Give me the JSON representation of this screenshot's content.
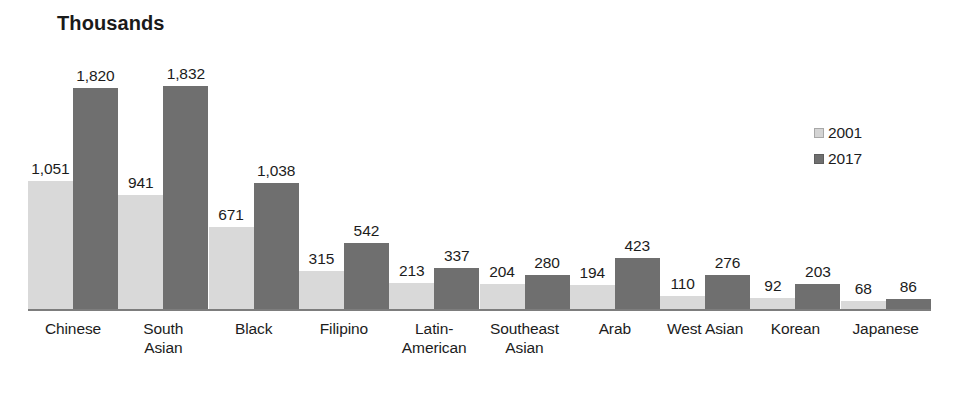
{
  "chart_data": {
    "type": "bar",
    "title": "Thousands",
    "xlabel": "",
    "ylabel": "",
    "ylim": [
      0,
      1832
    ],
    "grid": false,
    "legend_position": "right",
    "categories": [
      "Chinese",
      "South Asian",
      "Black",
      "Filipino",
      "Latin-American",
      "Southeast Asian",
      "Arab",
      "West Asian",
      "Korean",
      "Japanese"
    ],
    "category_lines": [
      [
        "Chinese"
      ],
      [
        "South",
        "Asian"
      ],
      [
        "Black"
      ],
      [
        "Filipino"
      ],
      [
        "Latin-",
        "American"
      ],
      [
        "Southeast",
        "Asian"
      ],
      [
        "Arab"
      ],
      [
        "West Asian"
      ],
      [
        "Korean"
      ],
      [
        "Japanese"
      ]
    ],
    "series": [
      {
        "name": "2001",
        "color": "#d9d9d9",
        "values": [
          1051,
          941,
          671,
          315,
          213,
          204,
          194,
          110,
          92,
          68
        ],
        "value_labels": [
          "1,051",
          "941",
          "671",
          "315",
          "213",
          "204",
          "194",
          "110",
          "92",
          "68"
        ]
      },
      {
        "name": "2017",
        "color": "#6f6f6f",
        "values": [
          1820,
          1832,
          1038,
          542,
          337,
          280,
          423,
          276,
          203,
          86
        ],
        "value_labels": [
          "1,820",
          "1,832",
          "1,038",
          "542",
          "337",
          "280",
          "423",
          "276",
          "203",
          "86"
        ]
      }
    ]
  },
  "legend": {
    "entries": [
      {
        "label": "2001"
      },
      {
        "label": "2017"
      }
    ]
  }
}
